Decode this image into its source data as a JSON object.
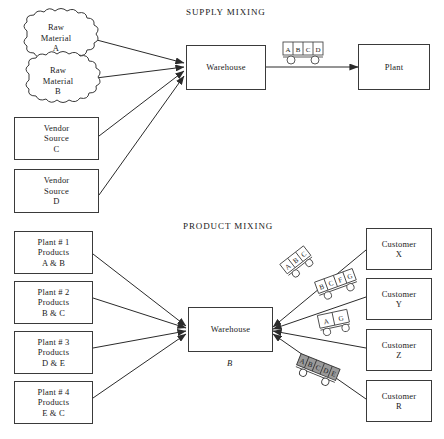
{
  "diagram": {
    "title_supply": "SUPPLY MIXING",
    "title_product": "PRODUCT MIXING",
    "warehouse_label": "Warehouse",
    "warehouse_sub_label": "B",
    "plant_label": "Plant"
  },
  "supply": {
    "sources": [
      {
        "id": "raw-material-a",
        "shape": "cloud",
        "lines": [
          "Raw",
          "Material",
          "A"
        ]
      },
      {
        "id": "raw-material-b",
        "shape": "cloud",
        "lines": [
          "Raw",
          "Material",
          "B"
        ]
      },
      {
        "id": "vendor-source-c",
        "shape": "box",
        "lines": [
          "Vendor",
          "Source",
          "C"
        ]
      },
      {
        "id": "vendor-source-d",
        "shape": "box",
        "lines": [
          "Vendor",
          "Source",
          "D"
        ]
      }
    ],
    "cart": {
      "id": "supply-cart",
      "compartments": [
        "A",
        "B",
        "C",
        "D"
      ]
    },
    "destination": {
      "id": "plant",
      "lines": [
        "Plant"
      ]
    }
  },
  "product": {
    "plants": [
      {
        "id": "plant-1",
        "lines": [
          "Plant # 1",
          "Products",
          "A & B"
        ]
      },
      {
        "id": "plant-2",
        "lines": [
          "Plant # 2",
          "Products",
          "B & C"
        ]
      },
      {
        "id": "plant-3",
        "lines": [
          "Plant # 3",
          "Products",
          "D & E"
        ]
      },
      {
        "id": "plant-4",
        "lines": [
          "Plant # 4",
          "Products",
          "E & C"
        ]
      }
    ],
    "customers": [
      {
        "id": "customer-x",
        "lines": [
          "Customer",
          "X"
        ]
      },
      {
        "id": "customer-y",
        "lines": [
          "Customer",
          "Y"
        ]
      },
      {
        "id": "customer-z",
        "lines": [
          "Customer",
          "Z"
        ]
      },
      {
        "id": "customer-r",
        "lines": [
          "Customer",
          "R"
        ]
      }
    ],
    "carts": [
      {
        "id": "product-cart-1",
        "compartments": [
          "A",
          "B",
          "C"
        ],
        "shaded": false
      },
      {
        "id": "product-cart-2",
        "compartments": [
          "B",
          "C",
          "F",
          "G"
        ],
        "shaded": false
      },
      {
        "id": "product-cart-3",
        "compartments": [
          "A",
          "G"
        ],
        "shaded": false
      },
      {
        "id": "product-cart-4",
        "compartments": [
          "A",
          "B",
          "C",
          "D",
          "E"
        ],
        "shaded": true
      }
    ]
  },
  "colors": {
    "stroke": "#3a3a3a",
    "line": "#2b2b2b",
    "text": "#1a1a1a",
    "cart_shade": "#9a9a9a",
    "background": "#ffffff"
  }
}
